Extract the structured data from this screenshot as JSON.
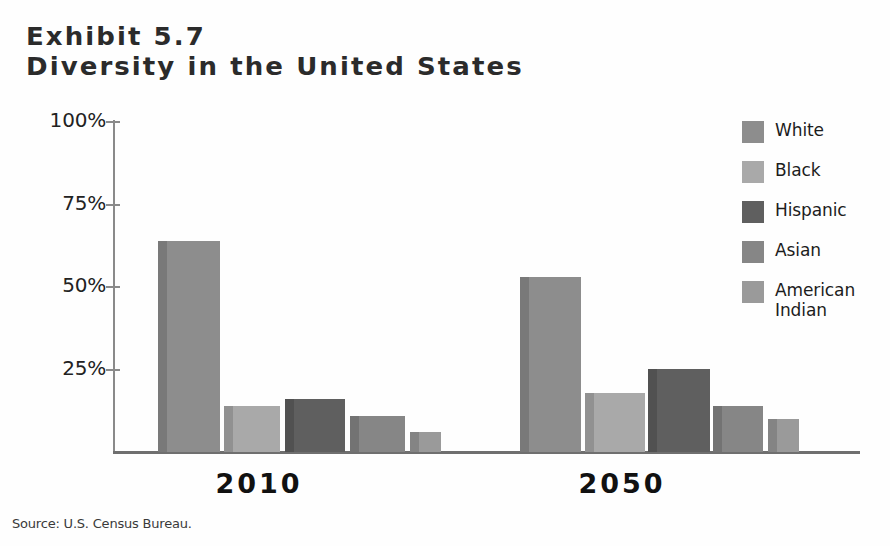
{
  "exhibit": {
    "number_line": "Exhibit 5.7",
    "title_line": "Diversity in the United States"
  },
  "source": {
    "text": "Source: U.S. Census Bureau."
  },
  "legend": {
    "position": "right",
    "items": [
      {
        "label": "White",
        "color": "#8d8d8d"
      },
      {
        "label": "Black",
        "color": "#a9a9a9"
      },
      {
        "label": "Hispanic",
        "color": "#5f5f5f"
      },
      {
        "label": "Asian",
        "color": "#868686"
      },
      {
        "label": "American Indian",
        "color": "#9a9a9a"
      }
    ]
  },
  "axes": {
    "y_ticks": [
      "100%",
      "75%",
      "50%",
      "25%"
    ],
    "y_tick_values": [
      100,
      75,
      50,
      25
    ],
    "x_labels": [
      "2010",
      "2050"
    ]
  },
  "chart_data": {
    "type": "bar",
    "title": "Diversity in the United States",
    "subtitle": "Exhibit 5.7",
    "xlabel": "",
    "ylabel": "",
    "ylim": [
      0,
      100
    ],
    "grid": false,
    "legend_position": "right",
    "categories": [
      "2010",
      "2050"
    ],
    "series": [
      {
        "name": "White",
        "values": [
          64,
          53
        ],
        "color": "#8d8d8d"
      },
      {
        "name": "Black",
        "values": [
          14,
          18
        ],
        "color": "#a9a9a9"
      },
      {
        "name": "Hispanic",
        "values": [
          16,
          25
        ],
        "color": "#5f5f5f"
      },
      {
        "name": "Asian",
        "values": [
          11,
          14
        ],
        "color": "#868686"
      },
      {
        "name": "American Indian",
        "values": [
          6,
          10
        ],
        "color": "#9a9a9a"
      }
    ],
    "y_tick_labels": [
      "25%",
      "50%",
      "75%",
      "100%"
    ],
    "source": "Source: U.S. Census Bureau."
  },
  "geometry": {
    "baseline_y": 452,
    "top_y": 122,
    "bar_groups": [
      {
        "name": "2010",
        "label_center": 259,
        "bar_left": [
          158,
          224,
          285,
          350,
          410
        ],
        "bar_width": [
          62,
          56,
          60,
          55,
          31
        ]
      },
      {
        "name": "2050",
        "label_center": 622,
        "bar_left": [
          520,
          585,
          648,
          713,
          768
        ],
        "bar_width": [
          61,
          60,
          62,
          50,
          31
        ]
      }
    ]
  }
}
